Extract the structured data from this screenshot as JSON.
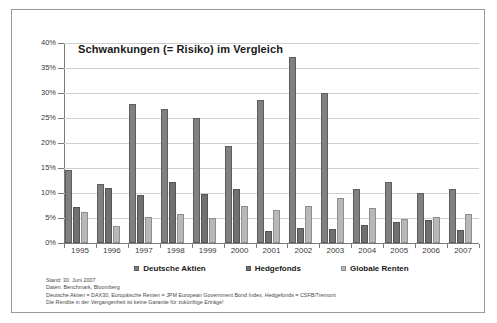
{
  "chart_data": {
    "type": "bar",
    "title": "Schwankungen (= Risiko) im Vergleich",
    "xlabel": "",
    "ylabel": "",
    "ylim": [
      0,
      40
    ],
    "ytick_labels": [
      "0%",
      "5%",
      "10%",
      "15%",
      "20%",
      "25%",
      "30%",
      "35%",
      "40%"
    ],
    "ytick_values": [
      0,
      5,
      10,
      15,
      20,
      25,
      30,
      35,
      40
    ],
    "grid": true,
    "legend_position": "bottom",
    "categories": [
      "1995",
      "1996",
      "1997",
      "1998",
      "1999",
      "2000",
      "2001",
      "2002",
      "2003",
      "2004",
      "2005",
      "2006",
      "2007"
    ],
    "series": [
      {
        "name": "Deutsche Aktien",
        "color": "#808080",
        "values": [
          14.7,
          11.9,
          27.8,
          26.8,
          25.1,
          19.4,
          28.7,
          37.3,
          30.1,
          10.9,
          12.3,
          10.0,
          10.9
        ]
      },
      {
        "name": "Hedgefonds",
        "color": "#707070",
        "values": [
          7.2,
          11.0,
          9.6,
          12.3,
          9.9,
          10.8,
          2.5,
          3.1,
          2.9,
          3.6,
          4.3,
          4.7,
          2.6
        ]
      },
      {
        "name": "Globale Renten",
        "color": "#b8b8b8",
        "values": [
          6.3,
          3.5,
          5.2,
          5.9,
          5.1,
          7.5,
          6.7,
          7.5,
          9.0,
          7.1,
          4.9,
          5.2,
          5.8
        ]
      }
    ]
  },
  "footnotes": [
    "Stand: 30. Juni 2007",
    "Daten: Benchmark, Bloomberg",
    "Deutsche Aktien = DAX30, Europäische Renten = JPM European Government Bond Index, Hedgefonds = CSFB/Tremont",
    "Die Rendite in der Vergangenheit ist keine Garantie für zukünftige Erträge!"
  ]
}
